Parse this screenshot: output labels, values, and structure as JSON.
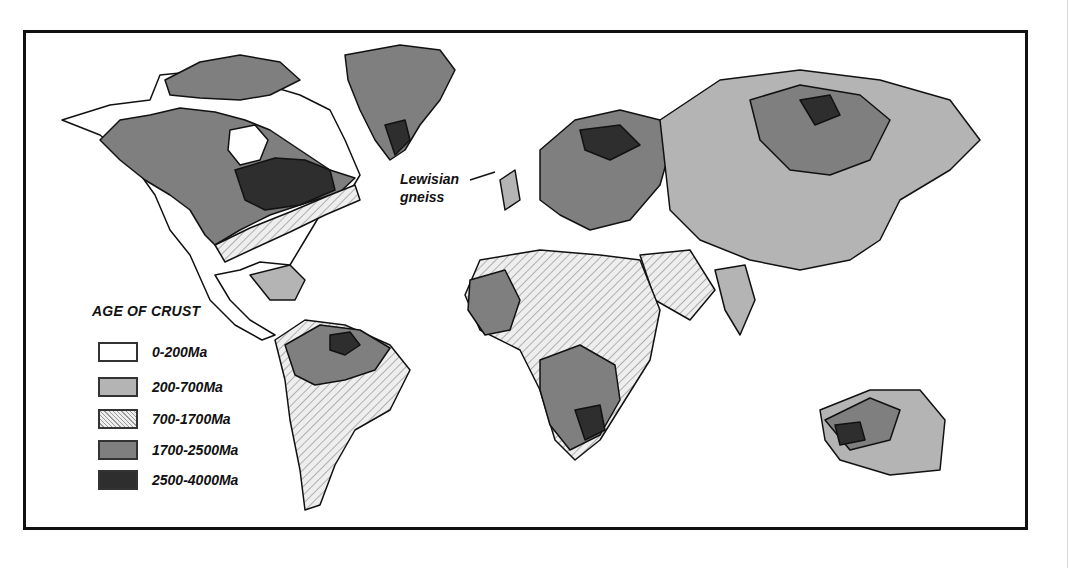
{
  "map": {
    "legend": {
      "title": "AGE OF CRUST",
      "items": [
        {
          "label": "0-200Ma",
          "fill": "#ffffff",
          "pattern": "none"
        },
        {
          "label": "200-700Ma",
          "fill": "#b4b4b4",
          "pattern": "none"
        },
        {
          "label": "700-1700Ma",
          "fill": "#e6e6e6",
          "pattern": "hatch"
        },
        {
          "label": "1700-2500Ma",
          "fill": "#7f7f7f",
          "pattern": "none"
        },
        {
          "label": "2500-4000Ma",
          "fill": "#2e2e2e",
          "pattern": "none"
        }
      ]
    },
    "annotation": {
      "line1": "Lewisian",
      "line2": "gneiss"
    }
  }
}
